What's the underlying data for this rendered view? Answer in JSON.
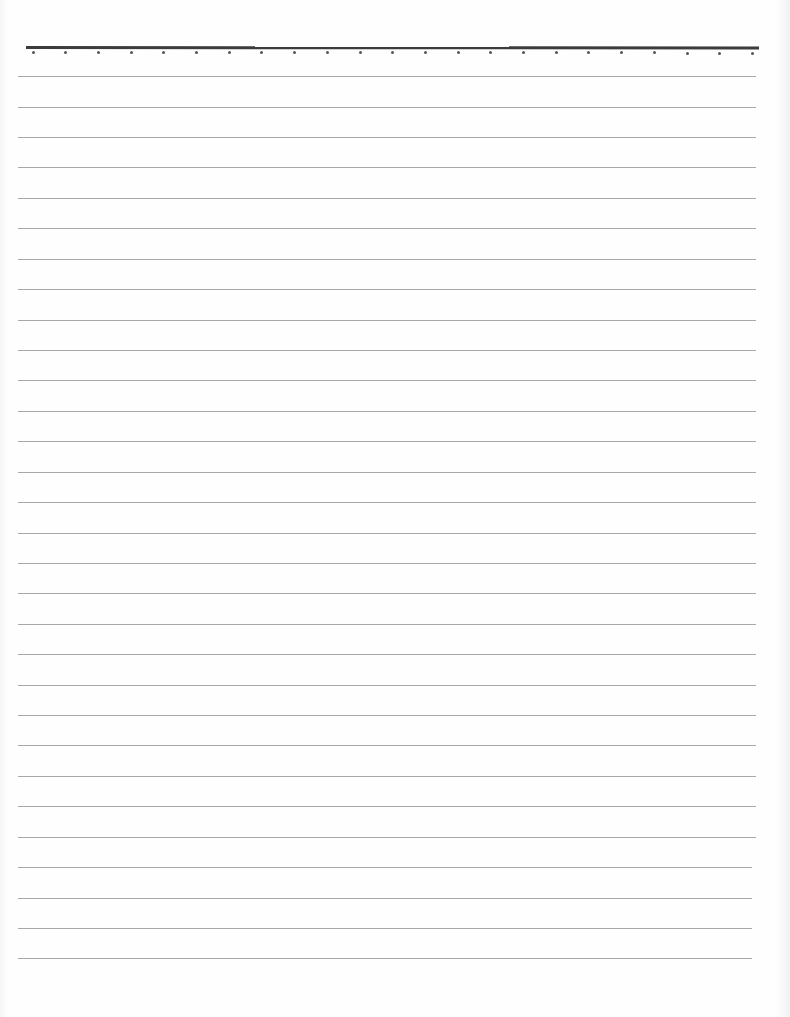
{
  "document": {
    "type": "lined-paper",
    "width": 790,
    "height": 1017,
    "background_color": "#fefefe",
    "top_rule": {
      "y": 46,
      "x_start": 26,
      "x_end": 759,
      "thickness": 3,
      "color": "#3c3c3c"
    },
    "dots": {
      "y": 52,
      "count": 23,
      "x_start": 33,
      "spacing": 32.7,
      "color": "#555555"
    },
    "rules": {
      "color": "#9a9a9a",
      "x_start": 18,
      "x_end": 756,
      "positions_y": [
        76,
        107,
        137,
        167,
        198,
        228,
        259,
        289,
        320,
        350,
        380,
        411,
        441,
        472,
        502,
        533,
        563,
        593,
        624,
        654,
        685,
        715,
        745,
        776,
        806,
        837,
        867,
        898,
        928,
        958
      ]
    }
  }
}
